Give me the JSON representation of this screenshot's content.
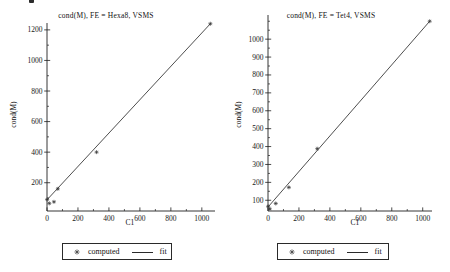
{
  "page": {
    "background": "#ffffff",
    "ink_color": "#1f1f1f",
    "stray_mark": "cropped-text-fragment-top-left"
  },
  "chart_data": [
    {
      "type": "scatter",
      "title": "cond(M), FE = Hexa8, VSMS",
      "xlabel": "C1",
      "ylabel": "cond(M)",
      "xlim": [
        0,
        1085
      ],
      "ylim": [
        15,
        1245
      ],
      "xticks": [
        0,
        200,
        400,
        600,
        800,
        1000
      ],
      "yticks": [
        200,
        400,
        600,
        800,
        1000,
        1200
      ],
      "x_minor_step": 100,
      "y_minor_step": 100,
      "grid": false,
      "legend_position": "bottom-center",
      "legend": {
        "computed": "computed",
        "fit": "fit"
      },
      "series": [
        {
          "name": "computed",
          "kind": "points",
          "points": [
            [
              1,
              90
            ],
            [
              15,
              65
            ],
            [
              45,
              75
            ],
            [
              70,
              160
            ],
            [
              320,
              400
            ],
            [
              1055,
              1240
            ]
          ]
        },
        {
          "name": "fit",
          "kind": "line",
          "points": [
            [
              0,
              88
            ],
            [
              1055,
              1240
            ]
          ]
        }
      ],
      "plot_box": {
        "left": 47,
        "top": 23,
        "right": 215,
        "bottom": 211
      }
    },
    {
      "type": "scatter",
      "title": "cond(M), FE = Tet4, VSMS",
      "xlabel": "C1",
      "ylabel": "cond(M)",
      "xlim": [
        0,
        1060
      ],
      "ylim": [
        40,
        1135
      ],
      "xticks": [
        0,
        200,
        400,
        600,
        800,
        1000
      ],
      "yticks": [
        100,
        200,
        300,
        400,
        500,
        600,
        700,
        800,
        900,
        1000
      ],
      "x_minor_step": 100,
      "y_minor_step": 50,
      "grid": false,
      "legend_position": "bottom-center",
      "legend": {
        "computed": "computed",
        "fit": "fit"
      },
      "series": [
        {
          "name": "computed",
          "kind": "points",
          "points": [
            [
              1,
              66
            ],
            [
              12,
              52
            ],
            [
              50,
              82
            ],
            [
              135,
              172
            ],
            [
              318,
              388
            ],
            [
              1045,
              1100
            ]
          ]
        },
        {
          "name": "fit",
          "kind": "line",
          "points": [
            [
              0,
              62
            ],
            [
              1045,
              1100
            ]
          ]
        }
      ],
      "plot_box": {
        "left": 43,
        "top": 15,
        "right": 207,
        "bottom": 211
      }
    }
  ]
}
